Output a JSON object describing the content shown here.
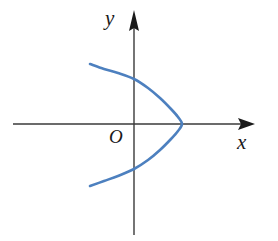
{
  "figure": {
    "background_color": "#ffffff",
    "axis_color": "#3a3a3a",
    "curve_color": "#4d80bf",
    "label_color": "#1a1a1a",
    "labels": {
      "x_axis": "x",
      "y_axis": "y",
      "origin": "O"
    }
  },
  "chart_data": {
    "type": "line",
    "xlabel": "x",
    "ylabel": "y",
    "grid": false,
    "legend": "none",
    "axes": {
      "origin_label": "O",
      "x_axis_arrow": "right",
      "y_axis_arrow": "up",
      "x_axis_pixel_span": [
        13,
        255
      ],
      "y_axis_pixel_span": [
        11,
        235
      ],
      "origin_pixel": [
        134,
        124
      ]
    },
    "series": [
      {
        "name": "parabola",
        "equation": "x = a - k*y^2 (opens left)",
        "color": "#4d80bf",
        "vertex_pixel": [
          182,
          124
        ],
        "endpoints_pixel": [
          [
            90,
            64
          ],
          [
            90,
            186
          ]
        ],
        "y_intercepts_pixel": [
          [
            134,
            74
          ],
          [
            134,
            176
          ]
        ],
        "points_pixel": [
          [
            90,
            64
          ],
          [
            104,
            69
          ],
          [
            118,
            73
          ],
          [
            134,
            79
          ],
          [
            148,
            88
          ],
          [
            160,
            98
          ],
          [
            171,
            109
          ],
          [
            178,
            117
          ],
          [
            182,
            124
          ],
          [
            178,
            131
          ],
          [
            171,
            139
          ],
          [
            160,
            150
          ],
          [
            148,
            160
          ],
          [
            134,
            169
          ],
          [
            118,
            176
          ],
          [
            104,
            181
          ],
          [
            90,
            186
          ]
        ]
      }
    ]
  }
}
